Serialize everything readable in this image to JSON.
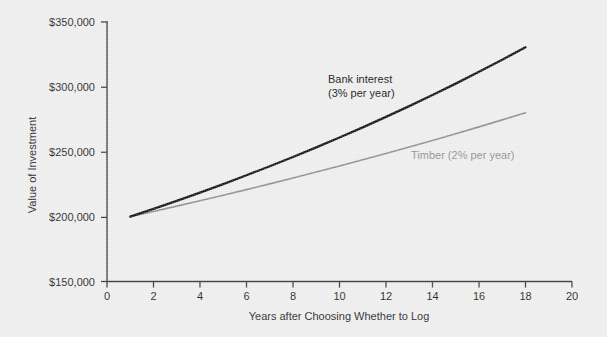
{
  "chart_data": {
    "type": "line",
    "title": "",
    "xlabel": "Years after Choosing Whether to Log",
    "ylabel": "Value of Investment",
    "xlim": [
      0,
      20
    ],
    "ylim": [
      150000,
      350000
    ],
    "grid": false,
    "legend_position": "inline-annotations",
    "x_ticks": [
      0,
      2,
      4,
      6,
      8,
      10,
      12,
      14,
      16,
      18,
      20
    ],
    "x_tick_labels": [
      "0",
      "2",
      "4",
      "6",
      "8",
      "10",
      "12",
      "14",
      "16",
      "18",
      "20"
    ],
    "y_ticks": [
      150000,
      200000,
      250000,
      300000,
      350000
    ],
    "y_tick_labels": [
      "$150,000",
      "$200,000",
      "$250,000",
      "$300,000",
      "$350,000"
    ],
    "x": [
      1,
      2,
      3,
      4,
      5,
      6,
      7,
      8,
      9,
      10,
      11,
      12,
      13,
      14,
      15,
      16,
      17,
      18
    ],
    "series": [
      {
        "name": "Bank interest (3% per year)",
        "color": "#111111",
        "values": [
          200000,
          206000,
          212180,
          218545,
          225102,
          231855,
          238810,
          245975,
          253354,
          260955,
          268783,
          276847,
          285152,
          293707,
          302518,
          311594,
          320941,
          330570
        ]
      },
      {
        "name": "Timber (2% per year)",
        "color": "#8e8e8e",
        "values": [
          200000,
          204000,
          208080,
          212242,
          216486,
          220816,
          225232,
          229737,
          234332,
          239019,
          243799,
          248675,
          253648,
          258721,
          263896,
          269174,
          274557,
          280048
        ]
      }
    ],
    "annotations": [
      {
        "name": "bank-interest-annotation",
        "line1": "Bank interest",
        "line2": "(3% per year)",
        "color": "#111111"
      },
      {
        "name": "timber-annotation",
        "line1": "Timber (2% per year)",
        "line2": "",
        "color": "#8e8e8e"
      }
    ],
    "colors": {
      "background": "#eeeeee",
      "axis": "#3a3a3a",
      "bank": "#111111",
      "timber": "#8e8e8e",
      "text": "#1e1e1e"
    }
  }
}
